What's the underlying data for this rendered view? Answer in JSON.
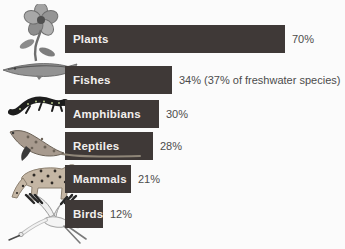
{
  "chart_data": {
    "type": "bar",
    "orientation": "horizontal",
    "title": "",
    "categories": [
      "Plants",
      "Fishes",
      "Amphibians",
      "Reptiles",
      "Mammals",
      "Birds"
    ],
    "values": [
      70,
      34,
      30,
      28,
      21,
      12
    ],
    "value_labels": [
      "70%",
      "34% (37% of freshwater species)",
      "30%",
      "28%",
      "21%",
      "12%"
    ],
    "xlim": [
      0,
      100
    ],
    "grid": false,
    "legend": "none",
    "bar_color": "#3f3937",
    "bar_label_color": "#f2efed",
    "value_label_color": "#4c4c4c",
    "background_color": "#fbfbfb",
    "icons": [
      "flower-photo",
      "gar-fish-photo",
      "spotted-salamander-photo",
      "lizard-photo",
      "cheetah-photo",
      "flying-crane-photo"
    ]
  }
}
